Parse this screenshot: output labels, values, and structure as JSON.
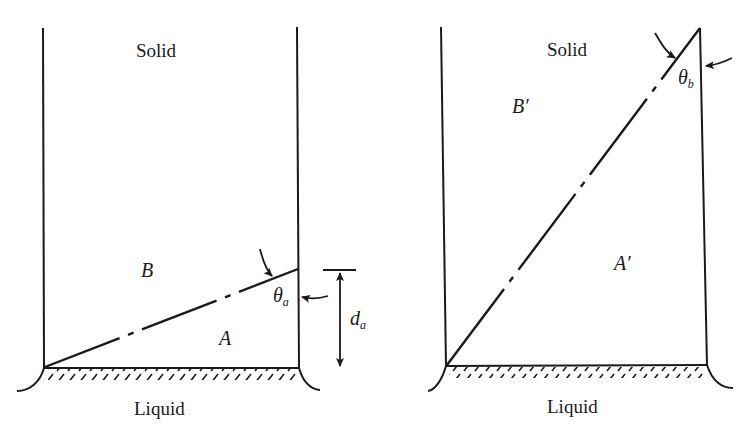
{
  "figure": {
    "panels": [
      {
        "id": "a",
        "top_phase_label": "Solid",
        "bottom_phase_label": "Liquid",
        "region_upper_label": "B",
        "region_lower_label": "A",
        "angle_label": "θ",
        "angle_subscript": "a",
        "dimension_label": "d",
        "dimension_subscript": "a"
      },
      {
        "id": "b",
        "top_phase_label": "Solid",
        "bottom_phase_label": "Liquid",
        "region_upper_label": "B′",
        "region_lower_label": "A′",
        "angle_label": "θ",
        "angle_subscript": "b"
      }
    ],
    "colors": {
      "ink": "#1a1a1a",
      "background": "#ffffff"
    }
  }
}
